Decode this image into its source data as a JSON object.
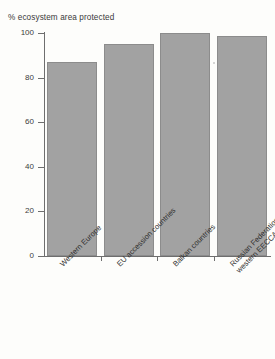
{
  "chart_data": {
    "type": "bar",
    "title": "% ecosystem area protected",
    "xlabel": "",
    "ylabel": "",
    "ylim": [
      0,
      100
    ],
    "yticks": [
      0,
      20,
      40,
      60,
      80,
      100
    ],
    "grid": false,
    "legend": null,
    "categories": [
      "Western Europe",
      "EU accession countries",
      "Balkan countries",
      "Russian Federation and western EECCA"
    ],
    "category_lines": [
      [
        "Western Europe"
      ],
      [
        "EU accession countries"
      ],
      [
        "Balkan countries"
      ],
      [
        "Russian Federation and",
        "western EECCA"
      ]
    ],
    "values": [
      87,
      95,
      100,
      98.5
    ],
    "bar_color": "#a2a2a2",
    "bar_edge_color": "#8c8c8c",
    "axis_color": "#6e6e6e",
    "text_color": "#3a3a3a",
    "background_color": "#fdfdfb"
  },
  "axis": {
    "y_tick_labels": [
      "0",
      "20",
      "40",
      "60",
      "80",
      "100"
    ]
  }
}
